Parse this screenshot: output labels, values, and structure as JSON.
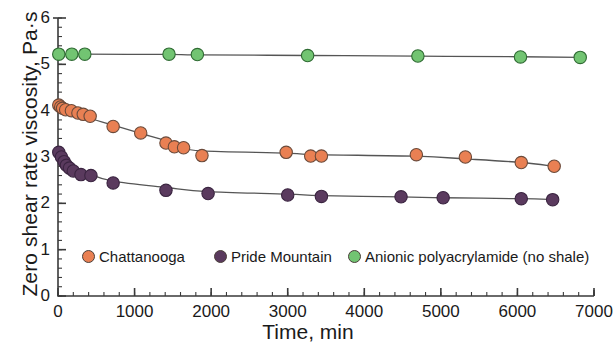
{
  "chart_data": {
    "type": "scatter",
    "title": "",
    "xlabel": "Time, min",
    "ylabel": "Zero shear rate viscosity, Pa·s",
    "xlim": [
      0,
      7000
    ],
    "ylim": [
      0,
      6
    ],
    "xticks": [
      0,
      1000,
      2000,
      3000,
      4000,
      5000,
      6000,
      7000
    ],
    "xtick_labels": [
      "0",
      "1000",
      "2000",
      "3000",
      "4000",
      "5000",
      "6000",
      "7000"
    ],
    "yticks": [
      0,
      1,
      2,
      3,
      4,
      5,
      6
    ],
    "ytick_labels": [
      "0",
      "1",
      "2",
      "3",
      "4",
      "5",
      "6"
    ],
    "x_minor_tick_interval": 200,
    "y_minor_tick_interval": 0.2,
    "grid": false,
    "legend_position": "bottom",
    "series": [
      {
        "name": "Chattanooga",
        "color": "#e98053",
        "edge_color": "#6b4a3a",
        "marker": "circle",
        "has_fit_curve": true,
        "points": [
          {
            "x": 10,
            "y": 4.12
          },
          {
            "x": 35,
            "y": 4.08
          },
          {
            "x": 60,
            "y": 4.05
          },
          {
            "x": 100,
            "y": 4.02
          },
          {
            "x": 175,
            "y": 4.0
          },
          {
            "x": 260,
            "y": 3.95
          },
          {
            "x": 330,
            "y": 3.92
          },
          {
            "x": 420,
            "y": 3.88
          },
          {
            "x": 720,
            "y": 3.66
          },
          {
            "x": 1080,
            "y": 3.52
          },
          {
            "x": 1410,
            "y": 3.3
          },
          {
            "x": 1520,
            "y": 3.22
          },
          {
            "x": 1640,
            "y": 3.2
          },
          {
            "x": 1880,
            "y": 3.03
          },
          {
            "x": 2980,
            "y": 3.1
          },
          {
            "x": 3300,
            "y": 3.02
          },
          {
            "x": 3440,
            "y": 3.02
          },
          {
            "x": 4680,
            "y": 3.05
          },
          {
            "x": 5320,
            "y": 3.0
          },
          {
            "x": 6050,
            "y": 2.88
          },
          {
            "x": 6480,
            "y": 2.8
          }
        ]
      },
      {
        "name": "Pride Mountain",
        "color": "#5a3a5e",
        "edge_color": "#3a2440",
        "marker": "circle",
        "has_fit_curve": true,
        "points": [
          {
            "x": 10,
            "y": 3.1
          },
          {
            "x": 45,
            "y": 3.0
          },
          {
            "x": 80,
            "y": 2.9
          },
          {
            "x": 110,
            "y": 2.82
          },
          {
            "x": 150,
            "y": 2.76
          },
          {
            "x": 200,
            "y": 2.7
          },
          {
            "x": 300,
            "y": 2.62
          },
          {
            "x": 430,
            "y": 2.6
          },
          {
            "x": 720,
            "y": 2.44
          },
          {
            "x": 1410,
            "y": 2.28
          },
          {
            "x": 1960,
            "y": 2.21
          },
          {
            "x": 3000,
            "y": 2.18
          },
          {
            "x": 3440,
            "y": 2.15
          },
          {
            "x": 4480,
            "y": 2.14
          },
          {
            "x": 5030,
            "y": 2.12
          },
          {
            "x": 6050,
            "y": 2.1
          },
          {
            "x": 6460,
            "y": 2.08
          }
        ]
      },
      {
        "name": "Anionic polyacrylamide (no shale)",
        "color": "#72c472",
        "edge_color": "#2f6b33",
        "marker": "circle",
        "has_fit_curve": true,
        "points": [
          {
            "x": 10,
            "y": 5.22
          },
          {
            "x": 180,
            "y": 5.22
          },
          {
            "x": 350,
            "y": 5.22
          },
          {
            "x": 1450,
            "y": 5.22
          },
          {
            "x": 1820,
            "y": 5.21
          },
          {
            "x": 3260,
            "y": 5.19
          },
          {
            "x": 4700,
            "y": 5.18
          },
          {
            "x": 6040,
            "y": 5.16
          },
          {
            "x": 6820,
            "y": 5.15
          }
        ]
      }
    ]
  },
  "axes": {
    "x_title": "Time, min",
    "y_title": "Zero shear rate viscosity, Pa·s"
  },
  "legend": {
    "items": [
      {
        "label": "Chattanooga",
        "color": "#e98053"
      },
      {
        "label": "Pride Mountain",
        "color": "#5a3a5e"
      },
      {
        "label": "Anionic polyacrylamide (no shale)",
        "color": "#72c472"
      }
    ]
  },
  "colors": {
    "chattanooga": "#e98053",
    "pride_mountain": "#5a3a5e",
    "anionic_polyacrylamide": "#72c472",
    "axis": "#3a3a3a",
    "curve": "#555555",
    "background": "#ffffff"
  }
}
